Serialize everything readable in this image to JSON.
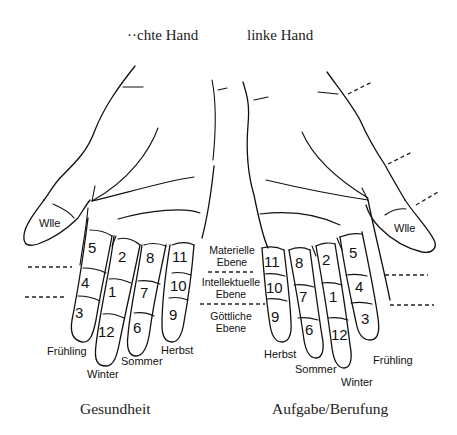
{
  "titles": {
    "right_hand": "rechte Hand",
    "right_hand_visible": "··chte Hand",
    "left_hand": "linke Hand"
  },
  "captions": {
    "left_side": "Gesundheit",
    "right_side": "Aufgabe/Berufung"
  },
  "thumb_label": "Wlle",
  "planes": {
    "material": [
      "Materielle",
      "Ebene"
    ],
    "intellectual": [
      "Intellektuelle",
      "Ebene"
    ],
    "divine": [
      "Göttliche",
      "Ebene"
    ]
  },
  "seasons": {
    "spring": "Frühling",
    "winter": "Winter",
    "summer": "Sommer",
    "autumn": "Herbst"
  },
  "left_hand_fingers": [
    {
      "finger": "index",
      "season": "Frühling",
      "segments": [
        "5",
        "4",
        "3"
      ]
    },
    {
      "finger": "middle",
      "season": "Winter",
      "segments": [
        "2",
        "1",
        "12"
      ]
    },
    {
      "finger": "ring",
      "season": "Sommer",
      "segments": [
        "8",
        "7",
        "6"
      ]
    },
    {
      "finger": "little",
      "season": "Herbst",
      "segments": [
        "11",
        "10",
        "9"
      ]
    }
  ],
  "right_hand_fingers": [
    {
      "finger": "little",
      "season": "Herbst",
      "segments": [
        "11",
        "10",
        "9"
      ]
    },
    {
      "finger": "ring",
      "season": "Sommer",
      "segments": [
        "8",
        "7",
        "6"
      ]
    },
    {
      "finger": "middle",
      "season": "Winter",
      "segments": [
        "2",
        "1",
        "12"
      ]
    },
    {
      "finger": "index",
      "season": "Frühling",
      "segments": [
        "5",
        "4",
        "3"
      ]
    }
  ],
  "colors": {
    "ink": "#111111",
    "background": "#ffffff"
  }
}
